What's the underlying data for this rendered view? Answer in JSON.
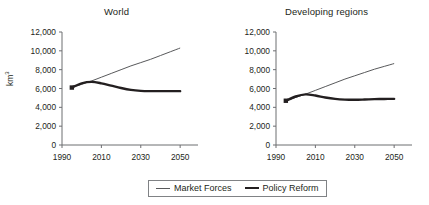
{
  "figure": {
    "background": "#ffffff",
    "text_color": "#231f20"
  },
  "legend": {
    "position": "bottom-center",
    "entries": [
      {
        "label": "Market Forces",
        "color": "#58595b",
        "style": "thin-line",
        "icon": "line-swatch-icon"
      },
      {
        "label": "Policy Reform",
        "color": "#231f20",
        "style": "thick-line",
        "icon": "line-swatch-icon"
      }
    ]
  },
  "panels": [
    {
      "id": "world",
      "title": "World",
      "ylabel": "km",
      "ylabel_sup": "3",
      "ytick_labels": [
        "12,000",
        "10,000",
        "8,000",
        "6,000",
        "4,000",
        "2,000",
        "0"
      ],
      "xtick_labels": [
        "1990",
        "2010",
        "2030",
        "2050"
      ]
    },
    {
      "id": "developing-regions",
      "title": "Developing regions",
      "ylabel": "",
      "ylabel_sup": "",
      "ytick_labels": [
        "12,000",
        "10,000",
        "8,000",
        "6,000",
        "4,000",
        "2,000",
        "0"
      ],
      "xtick_labels": [
        "1990",
        "2010",
        "2030",
        "2050"
      ]
    }
  ],
  "chart_data": [
    {
      "type": "line",
      "title": "World",
      "xlabel": "",
      "ylabel": "km3",
      "xlim": [
        1990,
        2055
      ],
      "ylim": [
        0,
        12000
      ],
      "yticks": [
        0,
        2000,
        4000,
        6000,
        8000,
        10000,
        12000
      ],
      "xticks": [
        1990,
        2010,
        2030,
        2050
      ],
      "grid": false,
      "legend_position": "bottom-center",
      "x": [
        1995,
        2000,
        2005,
        2010,
        2015,
        2020,
        2025,
        2030,
        2035,
        2040,
        2045,
        2050
      ],
      "series": [
        {
          "name": "Market Forces",
          "color": "#58595b",
          "values": [
            6100,
            6450,
            6800,
            7200,
            7600,
            8000,
            8400,
            8750,
            9100,
            9500,
            9900,
            10300
          ]
        },
        {
          "name": "Policy Reform",
          "color": "#231f20",
          "values": [
            6100,
            6550,
            6700,
            6550,
            6300,
            6050,
            5850,
            5750,
            5720,
            5720,
            5720,
            5720
          ]
        }
      ],
      "start_marker": {
        "x": 1995,
        "y": 6100
      }
    },
    {
      "type": "line",
      "title": "Developing regions",
      "xlabel": "",
      "ylabel": "",
      "xlim": [
        1990,
        2055
      ],
      "ylim": [
        0,
        12000
      ],
      "yticks": [
        0,
        2000,
        4000,
        6000,
        8000,
        10000,
        12000
      ],
      "xticks": [
        1990,
        2010,
        2030,
        2050
      ],
      "grid": false,
      "legend_position": "bottom-center",
      "x": [
        1995,
        2000,
        2005,
        2010,
        2015,
        2020,
        2025,
        2030,
        2035,
        2040,
        2045,
        2050
      ],
      "series": [
        {
          "name": "Market Forces",
          "color": "#58595b",
          "values": [
            4700,
            5050,
            5400,
            5800,
            6200,
            6600,
            7000,
            7350,
            7700,
            8050,
            8350,
            8650
          ]
        },
        {
          "name": "Policy Reform",
          "color": "#231f20",
          "values": [
            4700,
            5150,
            5380,
            5250,
            5050,
            4900,
            4820,
            4800,
            4830,
            4870,
            4890,
            4900
          ]
        }
      ],
      "start_marker": {
        "x": 1995,
        "y": 4700
      }
    }
  ]
}
